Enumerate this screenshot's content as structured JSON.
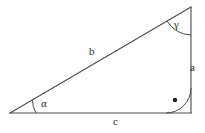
{
  "figure": {
    "kind": "right-triangle-diagram",
    "background_color": "#ffffff",
    "stroke_color": "#4a4a4a",
    "text_color": "#2b2b2b",
    "stroke_width": 1
  },
  "geometry": {
    "vertices": {
      "left": {
        "name": "A",
        "x": 10,
        "y": 113
      },
      "bottom_right": {
        "name": "B",
        "x": 191,
        "y": 113
      },
      "top_right": {
        "name": "C",
        "x": 191,
        "y": 7
      }
    },
    "sides": [
      {
        "id": "a",
        "from": "C",
        "to": "B",
        "orientation": "vertical-right"
      },
      {
        "id": "b",
        "from": "A",
        "to": "C",
        "orientation": "hypotenuse"
      },
      {
        "id": "c",
        "from": "A",
        "to": "B",
        "orientation": "horizontal-base"
      }
    ],
    "angles": [
      {
        "id": "alpha",
        "at": "A",
        "marker": "arc",
        "arc_radius": 26
      },
      {
        "id": "gamma",
        "at": "C",
        "marker": "arc",
        "arc_radius": 28
      },
      {
        "id": "right_angle",
        "at": "B",
        "marker": "arc-with-dot",
        "arc_radius": 25,
        "dot_radius": 2.2
      }
    ]
  },
  "labels": {
    "side_a": "a",
    "side_b": "b",
    "side_c": "c",
    "angle_alpha": "α",
    "angle_gamma": "γ"
  }
}
